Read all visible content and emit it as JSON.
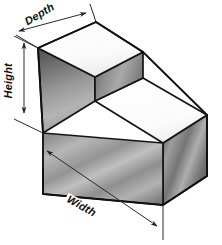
{
  "figure": {
    "type": "isometric-technical-drawing",
    "background_color": "#ffffff"
  },
  "dimensions": {
    "depth": {
      "label": "Depth",
      "icon": "double-arrow-icon",
      "orientation": "upper-left-receding-edge",
      "rotation_degrees": -31
    },
    "height": {
      "label": "Height",
      "icon": "double-arrow-icon",
      "orientation": "vertical-left-side",
      "rotation_degrees": -90
    },
    "width": {
      "label": "Width",
      "icon": "double-arrow-icon",
      "orientation": "lower-front-edge",
      "rotation_degrees": 29
    }
  },
  "solid": {
    "shape": "L-shaped-stepped-block",
    "faces": [
      {
        "name": "upper-top-face",
        "shade": "#fdfdfd",
        "role": "top of raised step"
      },
      {
        "name": "upper-left-face",
        "shade": "#6f6f6f",
        "role": "left side of raised step"
      },
      {
        "name": "upper-right-face",
        "shade": "#8d8d8d",
        "role": "right riser of step"
      },
      {
        "name": "lower-top-face",
        "shade": "#fbfbfb",
        "role": "top of lower ledge"
      },
      {
        "name": "lower-left-face",
        "shade": "#8a8a8a",
        "role": "long front-left side"
      },
      {
        "name": "lower-right-face",
        "shade": "#7e7e7e",
        "role": "right end face"
      }
    ],
    "outline_color": "#141414",
    "dimension_line_color": "#2a2a2a"
  }
}
